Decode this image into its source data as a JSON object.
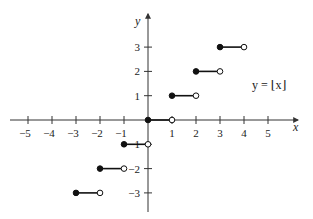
{
  "chart_data": {
    "type": "line",
    "title": "",
    "function_label": "y = ⌊x⌋",
    "xlabel": "x",
    "ylabel": "y",
    "xlim": [
      -6,
      6.2
    ],
    "ylim": [
      -3.8,
      4.3
    ],
    "grid": false,
    "x_ticks": [
      -5,
      -4,
      -3,
      -2,
      -1,
      1,
      2,
      3,
      4,
      5
    ],
    "x_tick_labels": [
      "−5",
      "−4",
      "−3",
      "−2",
      "−1",
      "1",
      "2",
      "3",
      "4",
      "5"
    ],
    "y_ticks": [
      3,
      2,
      1,
      -1,
      -2,
      -3
    ],
    "y_tick_labels": [
      "3",
      "2",
      "1",
      "−1",
      "−2",
      "−3"
    ],
    "segments": [
      {
        "x_start": -3,
        "x_end": -2,
        "y": -3,
        "start_closed": true,
        "end_closed": false
      },
      {
        "x_start": -2,
        "x_end": -1,
        "y": -2,
        "start_closed": true,
        "end_closed": false
      },
      {
        "x_start": -1,
        "x_end": 0,
        "y": -1,
        "start_closed": true,
        "end_closed": false
      },
      {
        "x_start": 0,
        "x_end": 1,
        "y": 0,
        "start_closed": true,
        "end_closed": false
      },
      {
        "x_start": 1,
        "x_end": 2,
        "y": 1,
        "start_closed": true,
        "end_closed": false
      },
      {
        "x_start": 2,
        "x_end": 3,
        "y": 2,
        "start_closed": true,
        "end_closed": false
      },
      {
        "x_start": 3,
        "x_end": 4,
        "y": 3,
        "start_closed": true,
        "end_closed": false
      }
    ]
  },
  "colors": {
    "axis": "#333333",
    "line": "#111111",
    "point_fill_closed": "#111111",
    "point_fill_open": "#ffffff"
  }
}
